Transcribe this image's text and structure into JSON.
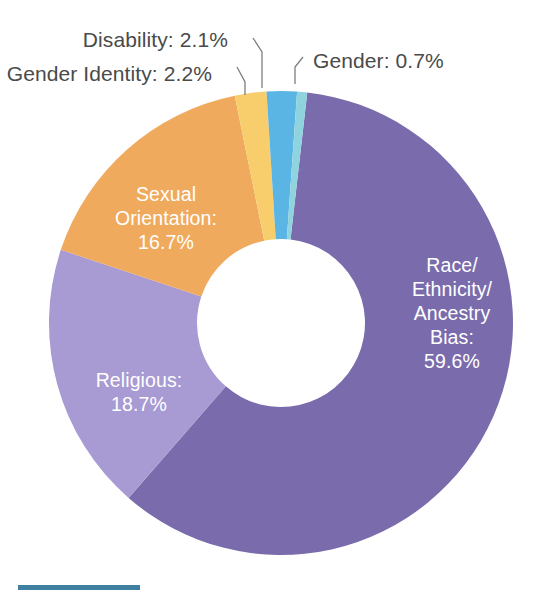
{
  "chart_data": {
    "type": "pie",
    "variant": "donut",
    "title": "",
    "subtitle": "",
    "xlabel": "",
    "ylabel": "",
    "legend": "none",
    "grid": false,
    "units": "percent",
    "total": 100.0,
    "categories": [
      "Race/Ethnicity/Ancestry Bias",
      "Religious",
      "Sexual Orientation",
      "Gender Identity",
      "Disability",
      "Gender"
    ],
    "values": [
      59.6,
      18.7,
      16.7,
      2.2,
      2.1,
      0.7
    ],
    "colors": [
      "#7a6cac",
      "#a89ad2",
      "#f0aa5e",
      "#f7ce6b",
      "#5bb5e4",
      "#8fd3df"
    ],
    "slices": [
      {
        "name": "Race/Ethnicity/Ancestry Bias",
        "value": 59.6,
        "value_label": "59.6%",
        "color": "#7a6cac",
        "label_placement": "inside",
        "label_lines": [
          "Race/",
          "Ethnicity/",
          "Ancestry",
          "Bias:",
          "59.6%"
        ]
      },
      {
        "name": "Religious",
        "value": 18.7,
        "value_label": "18.7%",
        "color": "#a89ad2",
        "label_placement": "inside",
        "label_lines": [
          "Religious:",
          "18.7%"
        ]
      },
      {
        "name": "Sexual Orientation",
        "value": 16.7,
        "value_label": "16.7%",
        "color": "#f0aa5e",
        "label_placement": "inside",
        "label_lines": [
          "Sexual",
          "Orientation:",
          "16.7%"
        ]
      },
      {
        "name": "Gender Identity",
        "value": 2.2,
        "value_label": "2.2%",
        "color": "#f7ce6b",
        "label_placement": "callout",
        "callout_text": "Gender Identity: 2.2%"
      },
      {
        "name": "Disability",
        "value": 2.1,
        "value_label": "2.1%",
        "color": "#5bb5e4",
        "label_placement": "callout",
        "callout_text": "Disability: 2.1%"
      },
      {
        "name": "Gender",
        "value": 0.7,
        "value_label": "0.7%",
        "color": "#8fd3df",
        "label_placement": "callout",
        "callout_text": "Gender: 0.7%"
      }
    ]
  },
  "callouts": {
    "disability": "Disability: 2.1%",
    "gender_identity": "Gender Identity: 2.2%",
    "gender": "Gender: 0.7%"
  },
  "slice_labels": {
    "race": {
      "line1": "Race/",
      "line2": "Ethnicity/",
      "line3": "Ancestry",
      "line4": "Bias:",
      "line5": "59.6%"
    },
    "religious": {
      "line1": "Religious:",
      "line2": "18.7%"
    },
    "sexual_orientation": {
      "line1": "Sexual",
      "line2": "Orientation:",
      "line3": "16.7%"
    }
  },
  "footer": {
    "rule_color": "#3f7fa0"
  },
  "palette": {
    "race": "#7a6cac",
    "religious": "#a89ad2",
    "sexual_orientation": "#f0aa5e",
    "gender_identity": "#f7ce6b",
    "disability": "#5bb5e4",
    "gender": "#8fd3df",
    "callout_text": "#4a4a4a",
    "slice_text": "#ffffff",
    "leader_line": "#7d7d7d",
    "background": "#ffffff"
  }
}
